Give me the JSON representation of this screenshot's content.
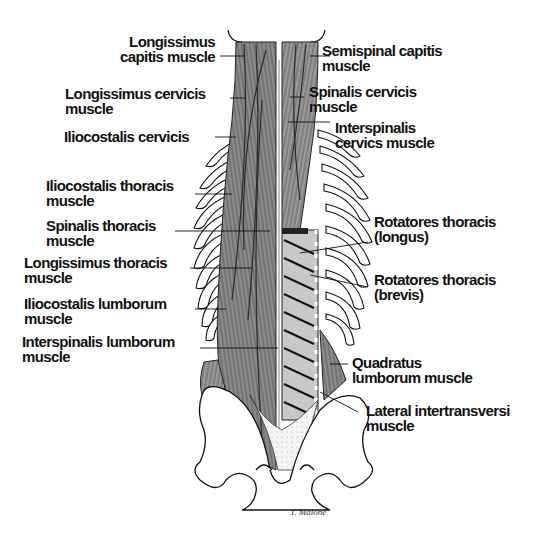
{
  "figure": {
    "type": "anatomical illustration",
    "signature": "T. Malone"
  },
  "labels_left": [
    {
      "id": "longissimus-capitis",
      "lines": [
        "Longissimus",
        "capitis muscle"
      ]
    },
    {
      "id": "longissimus-cervicis",
      "lines": [
        "Longissimus cervicis",
        "muscle"
      ]
    },
    {
      "id": "iliocostalis-cervicis",
      "lines": [
        "Iliocostalis cervicis"
      ]
    },
    {
      "id": "iliocostalis-thoracis",
      "lines": [
        "Iliocostalis thoracis",
        "muscle"
      ]
    },
    {
      "id": "spinalis-thoracis",
      "lines": [
        "Spinalis thoracis",
        "muscle"
      ]
    },
    {
      "id": "longissimus-thoracis",
      "lines": [
        "Longissimus thoracis",
        "muscle"
      ]
    },
    {
      "id": "iliocostalis-lumborum",
      "lines": [
        "Iliocostalis lumborum",
        "muscle"
      ]
    },
    {
      "id": "interspinalis-lumborum",
      "lines": [
        "Interspinalis lumborum",
        "muscle"
      ]
    }
  ],
  "labels_right": [
    {
      "id": "semispinal-capitis",
      "lines": [
        "Semispinal capitis",
        "muscle"
      ]
    },
    {
      "id": "spinalis-cervicis",
      "lines": [
        "Spinalis cervicis",
        "muscle"
      ]
    },
    {
      "id": "interspinalis-cervics",
      "lines": [
        "Interspinalis",
        "cervics muscle"
      ]
    },
    {
      "id": "rotatores-thoracis-longus",
      "lines": [
        "Rotatores thoracis",
        "(longus)"
      ]
    },
    {
      "id": "rotatores-thoracis-brevis",
      "lines": [
        "Rotatores thoracis",
        "(brevis)"
      ]
    },
    {
      "id": "quadratus-lumborum",
      "lines": [
        "Quadratus",
        "lumborum muscle"
      ]
    },
    {
      "id": "lateral-intertransversi",
      "lines": [
        "Lateral intertransversi",
        "muscle"
      ]
    }
  ],
  "colors": {
    "ink": "#111111",
    "muscle": "#8a8a8a",
    "muscle_dark": "#555555",
    "background": "#ffffff"
  }
}
